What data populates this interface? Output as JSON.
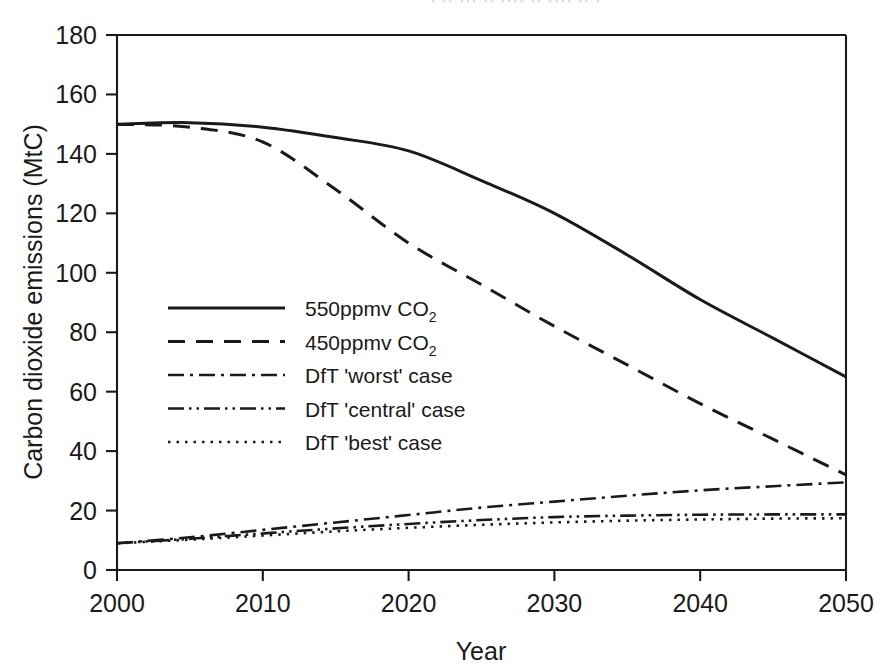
{
  "figure": {
    "partial_cut_title": "· ·· ··· ·· ···· ·· ···· ·· ·",
    "background_color": "#ffffff",
    "ink_color": "#1a1a1a"
  },
  "chart_data": {
    "type": "line",
    "title": "",
    "xlabel": "Year",
    "ylabel": "Carbon dioxide emissions (MtC)",
    "xlim": [
      2000,
      2050
    ],
    "ylim": [
      0,
      180
    ],
    "xticks": [
      2000,
      2010,
      2020,
      2030,
      2040,
      2050
    ],
    "yticks": [
      0,
      20,
      40,
      60,
      80,
      100,
      120,
      140,
      160,
      180
    ],
    "xticklabels": [
      "2000",
      "2010",
      "2020",
      "2030",
      "2040",
      "2050"
    ],
    "yticklabels": [
      "0",
      "20",
      "40",
      "60",
      "80",
      "100",
      "120",
      "140",
      "160",
      "180"
    ],
    "grid": false,
    "legend_position": "center-left",
    "x": [
      2000,
      2005,
      2010,
      2015,
      2020,
      2025,
      2030,
      2035,
      2040,
      2045,
      2050
    ],
    "series": [
      {
        "name": "550ppmv CO2",
        "label_main": "550ppmv CO",
        "label_sub": "2",
        "style": "solid",
        "dasharray": "",
        "width": 3.0,
        "values": [
          150,
          150.5,
          149,
          145.5,
          141,
          131,
          120,
          106,
          91,
          78,
          65
        ]
      },
      {
        "name": "450ppmv CO2",
        "label_main": "450ppmv CO",
        "label_sub": "2",
        "style": "dashed",
        "dasharray": "17,11",
        "width": 3.0,
        "values": [
          150,
          149,
          144,
          128,
          110,
          96,
          82,
          69,
          56,
          44,
          32
        ]
      },
      {
        "name": "DfT 'worst' case",
        "label_main": "DfT 'worst' case",
        "label_sub": "",
        "style": "dashdot",
        "dasharray": "16,6,3,6",
        "width": 2.6,
        "values": [
          9,
          11,
          13.5,
          16,
          18.5,
          21,
          23,
          25,
          26.8,
          28.2,
          29.5
        ]
      },
      {
        "name": "DfT 'central' case",
        "label_main": "DfT 'central' case",
        "label_sub": "",
        "style": "dashdotdot",
        "dasharray": "16,5,2.5,5,2.5,5",
        "width": 2.6,
        "values": [
          9,
          10.5,
          12.3,
          14,
          15.5,
          16.8,
          17.8,
          18.3,
          18.6,
          18.7,
          18.7
        ]
      },
      {
        "name": "DfT 'best' case",
        "label_main": "DfT  'best' case",
        "label_sub": "",
        "style": "dotted",
        "dasharray": "2.5,6",
        "width": 2.6,
        "values": [
          9,
          10.2,
          11.6,
          13,
          14.2,
          15.2,
          16,
          16.6,
          17,
          17.3,
          17.4
        ]
      }
    ]
  }
}
